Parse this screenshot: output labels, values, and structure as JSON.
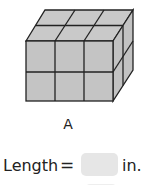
{
  "figure": {
    "shape": "rectangular prism made of unit cubes",
    "cubes_across": 3,
    "cubes_high": 2,
    "cubes_deep": 2,
    "face_color": "#c4c4c4",
    "edge_color": "#222222",
    "label": "A"
  },
  "question": {
    "prompt_label": "Length",
    "operator": "=",
    "answer_value": "",
    "unit": "in.",
    "answer_box_color": "#e6e6e6"
  }
}
